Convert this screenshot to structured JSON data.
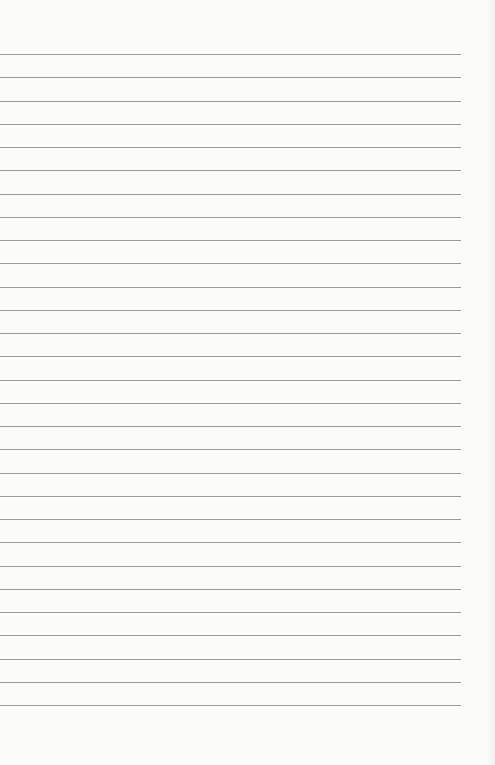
{
  "page": {
    "type": "lined-paper",
    "background": "#fbfbfa",
    "line_color": "#9a9a9a",
    "line_count": 29,
    "first_line_y": 54,
    "line_spacing": 23.25,
    "line_length": 461
  }
}
